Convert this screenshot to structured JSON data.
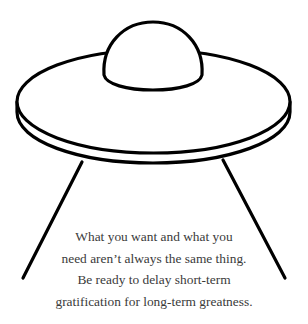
{
  "illustration": {
    "subject": "ufo-flying-saucer",
    "stroke_color": "#000000",
    "fill_color": "#ffffff"
  },
  "quote": {
    "lines": [
      "What you want and what you",
      "need aren’t always the same thing.",
      "Be ready to delay short-term",
      "gratification for long-term greatness."
    ],
    "text_color": "#3a3a3a"
  }
}
